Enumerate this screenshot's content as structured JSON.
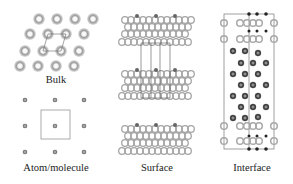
{
  "figure": {
    "panels": [
      {
        "id": "bulk",
        "label": "Bulk"
      },
      {
        "id": "atom",
        "label": "Atom/molecule"
      },
      {
        "id": "surface",
        "label": "Surface"
      },
      {
        "id": "interface",
        "label": "Interface"
      }
    ],
    "colors": {
      "ring_light": "#a8a8a8",
      "ring_dark": "#4a4a4a",
      "cell_line": "#777777",
      "background": "#ffffff"
    }
  }
}
